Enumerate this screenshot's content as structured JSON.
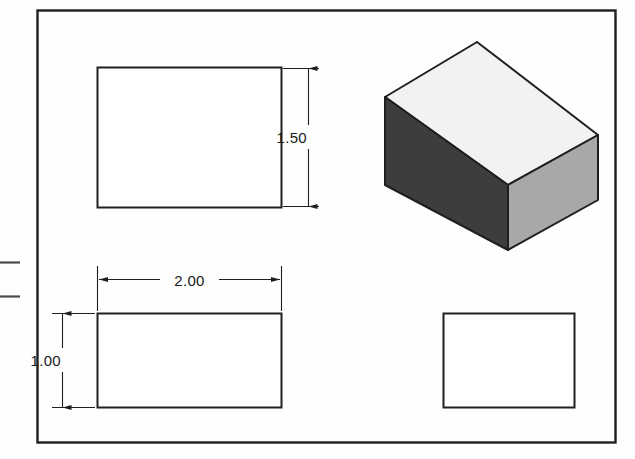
{
  "sheet": {
    "background_color": "#fefefe",
    "border_color": "#1f1f1f",
    "line_color": "#1f1f1f"
  },
  "drawing": {
    "title": "",
    "type": "orthographic-multiview-with-isometric",
    "projection": "third-angle"
  },
  "dimensions": [
    {
      "id": "height-1-50",
      "label": "1.50",
      "orientation": "vertical",
      "applies_to": "front-view",
      "arrow_style": "inward-filled"
    },
    {
      "id": "width-2-00",
      "label": "2.00",
      "orientation": "horizontal",
      "applies_to": "top-view",
      "arrow_style": "outward-filled"
    },
    {
      "id": "depth-1-00",
      "label": "1.00",
      "orientation": "vertical",
      "applies_to": "top-view",
      "arrow_style": "inward-filled"
    }
  ],
  "views": {
    "front": {
      "name": "front-view",
      "shape": "rectangle",
      "width_units": "2.00",
      "height_units": "1.50"
    },
    "top": {
      "name": "top-view",
      "shape": "rectangle",
      "width_units": "2.00",
      "height_units": "1.00"
    },
    "right_side": {
      "name": "right-side-view",
      "shape": "rectangle",
      "width_units": "1.00",
      "height_units": "1.50"
    },
    "isometric": {
      "name": "isometric-view",
      "shape": "rectangular-block",
      "faces": {
        "top": {
          "name": "top-face",
          "fill": "#f2f2f2"
        },
        "left": {
          "name": "left-face",
          "fill": "#3d3d3d"
        },
        "right": {
          "name": "right-face",
          "fill": "#a8a8a8"
        }
      }
    }
  },
  "page_marks": [
    {
      "id": "left-edge-mark-upper",
      "type": "tick"
    },
    {
      "id": "left-edge-mark-lower",
      "type": "tick"
    }
  ]
}
